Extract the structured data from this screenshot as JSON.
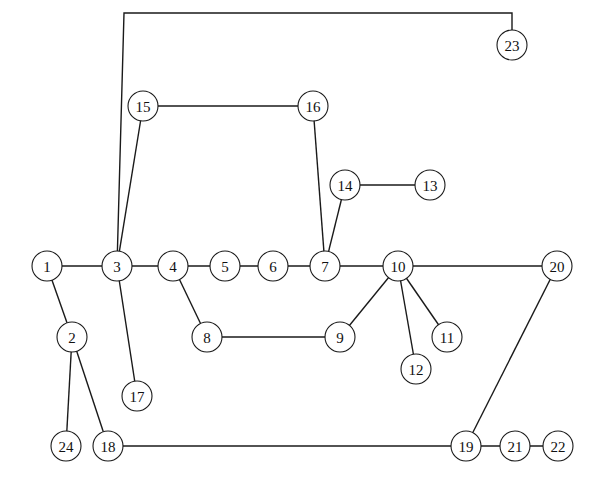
{
  "diagram": {
    "type": "graph",
    "node_radius": 15,
    "colors": {
      "stroke": "#1a1a1a",
      "fill": "#ffffff",
      "text": "#111111"
    },
    "nodes": [
      {
        "id": "1",
        "label": "1",
        "x": 47,
        "y": 266
      },
      {
        "id": "2",
        "label": "2",
        "x": 72,
        "y": 337
      },
      {
        "id": "3",
        "label": "3",
        "x": 117,
        "y": 266
      },
      {
        "id": "4",
        "label": "4",
        "x": 173,
        "y": 266
      },
      {
        "id": "5",
        "label": "5",
        "x": 225,
        "y": 266
      },
      {
        "id": "6",
        "label": "6",
        "x": 273,
        "y": 266
      },
      {
        "id": "7",
        "label": "7",
        "x": 325,
        "y": 266
      },
      {
        "id": "8",
        "label": "8",
        "x": 207,
        "y": 337
      },
      {
        "id": "9",
        "label": "9",
        "x": 340,
        "y": 337
      },
      {
        "id": "10",
        "label": "10",
        "x": 398,
        "y": 266
      },
      {
        "id": "11",
        "label": "11",
        "x": 447,
        "y": 337
      },
      {
        "id": "12",
        "label": "12",
        "x": 416,
        "y": 369
      },
      {
        "id": "13",
        "label": "13",
        "x": 430,
        "y": 185
      },
      {
        "id": "14",
        "label": "14",
        "x": 345,
        "y": 185
      },
      {
        "id": "15",
        "label": "15",
        "x": 143,
        "y": 106
      },
      {
        "id": "16",
        "label": "16",
        "x": 313,
        "y": 106
      },
      {
        "id": "17",
        "label": "17",
        "x": 137,
        "y": 396
      },
      {
        "id": "18",
        "label": "18",
        "x": 108,
        "y": 446
      },
      {
        "id": "19",
        "label": "19",
        "x": 466,
        "y": 446
      },
      {
        "id": "20",
        "label": "20",
        "x": 557,
        "y": 266
      },
      {
        "id": "21",
        "label": "21",
        "x": 515,
        "y": 446
      },
      {
        "id": "22",
        "label": "22",
        "x": 558,
        "y": 446
      },
      {
        "id": "23",
        "label": "23",
        "x": 512,
        "y": 45
      },
      {
        "id": "24",
        "label": "24",
        "x": 66,
        "y": 446
      }
    ],
    "edges": [
      {
        "from": "1",
        "to": "3"
      },
      {
        "from": "1",
        "to": "2"
      },
      {
        "from": "2",
        "to": "24"
      },
      {
        "from": "2",
        "to": "18"
      },
      {
        "from": "3",
        "to": "4"
      },
      {
        "from": "3",
        "to": "15"
      },
      {
        "from": "3",
        "to": "17"
      },
      {
        "from": "3",
        "to": "23",
        "via": [
          [
            124,
            13
          ],
          [
            512,
            13
          ]
        ]
      },
      {
        "from": "4",
        "to": "5"
      },
      {
        "from": "4",
        "to": "8"
      },
      {
        "from": "5",
        "to": "6"
      },
      {
        "from": "6",
        "to": "7"
      },
      {
        "from": "7",
        "to": "10"
      },
      {
        "from": "7",
        "to": "16"
      },
      {
        "from": "7",
        "to": "14"
      },
      {
        "from": "14",
        "to": "13"
      },
      {
        "from": "15",
        "to": "16"
      },
      {
        "from": "8",
        "to": "9"
      },
      {
        "from": "9",
        "to": "10"
      },
      {
        "from": "10",
        "to": "11"
      },
      {
        "from": "10",
        "to": "12"
      },
      {
        "from": "10",
        "to": "20"
      },
      {
        "from": "20",
        "to": "19"
      },
      {
        "from": "18",
        "to": "19"
      },
      {
        "from": "19",
        "to": "21"
      },
      {
        "from": "21",
        "to": "22"
      }
    ]
  }
}
